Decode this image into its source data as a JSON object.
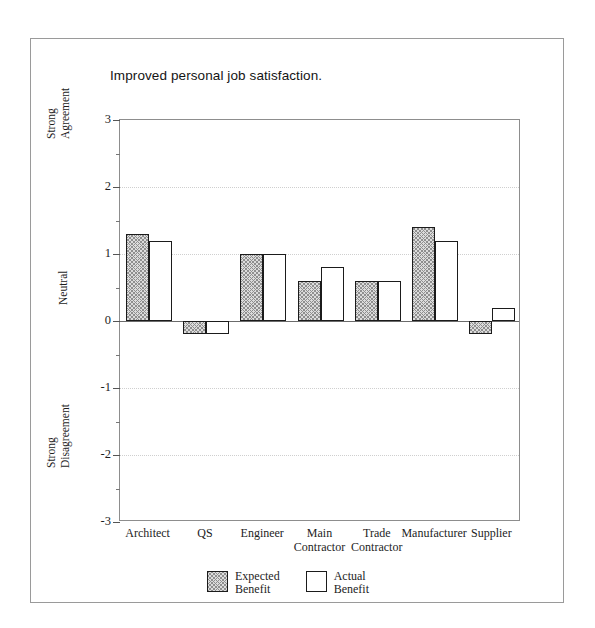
{
  "chart_data": {
    "type": "bar",
    "title": "Improved personal job satisfaction.",
    "xlabel": "",
    "ylabel": "",
    "ylim": [
      -3,
      3
    ],
    "grid": true,
    "legend_position": "bottom-center",
    "categories": [
      "Architect",
      "QS",
      "Engineer",
      "Main\nContractor",
      "Trade\nContractor",
      "Manufacturer",
      "Supplier"
    ],
    "series": [
      {
        "name": "Expected\nBenefit",
        "values": [
          1.3,
          -0.2,
          1.0,
          0.6,
          0.6,
          1.4,
          -0.2
        ]
      },
      {
        "name": "Actual\nBenefit",
        "values": [
          1.2,
          -0.2,
          1.0,
          0.8,
          0.6,
          1.2,
          0.2
        ]
      }
    ],
    "y_ticks_major": [
      3,
      2,
      1,
      0,
      -1,
      -2,
      -3
    ],
    "y_tick_labels": [
      "3",
      "2",
      "1",
      "0",
      "-1",
      "-2",
      "-3"
    ],
    "y_ticks_minor": [
      2.5,
      1.5,
      0.5,
      -0.5,
      -1.5,
      -2.5
    ],
    "y_axis_anchors": [
      {
        "label": "Strong\nAgreement",
        "value": 2.45
      },
      {
        "label": "Neutral",
        "value": 0
      },
      {
        "label": "Strong\nDisagreement",
        "value": -2.45
      }
    ]
  },
  "legend": {
    "entries": [
      {
        "label": "Expected\nBenefit",
        "pattern": "hatched"
      },
      {
        "label": "Actual\nBenefit",
        "pattern": "plain"
      }
    ]
  },
  "colors": {
    "bar_outline": "#1b1b1b",
    "bar_expected_fill": "#dcdcdc",
    "bar_expected_hatch": "#8f8f8f",
    "bar_actual_fill": "#ffffff",
    "axis": "#8d8d8d",
    "zero_line": "#6b6b6b",
    "gridline": "#cfcfcf",
    "frame": "#9a9a9a",
    "text": "#1d1d1d"
  }
}
